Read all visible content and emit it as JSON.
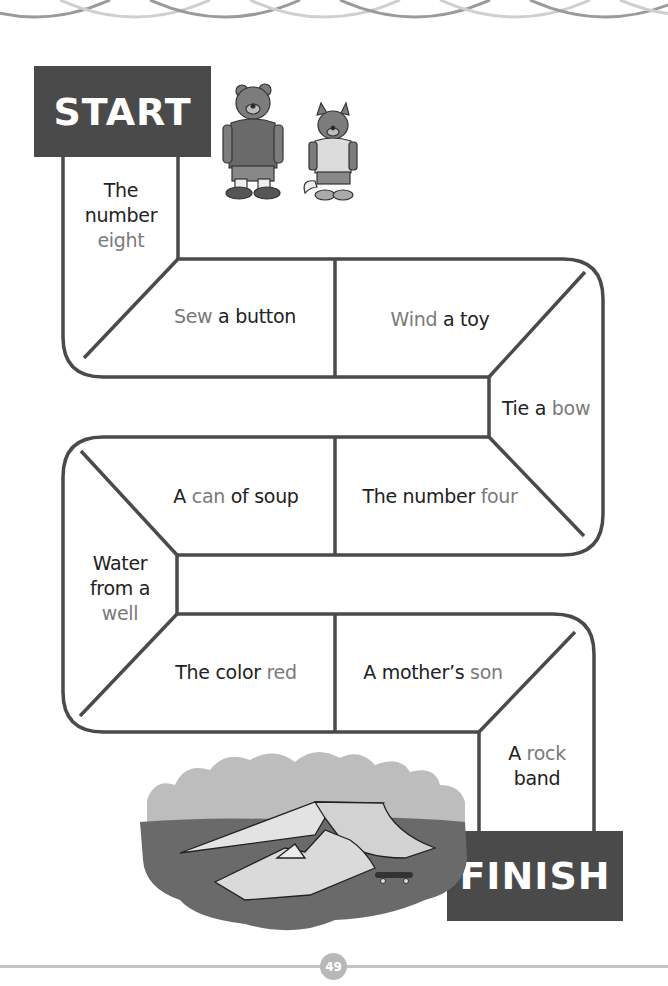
{
  "board": {
    "start_label": "START",
    "finish_label": "FINISH",
    "spaces": [
      {
        "id": 1,
        "parts": [
          {
            "t": "The",
            "hl": false
          },
          {
            "t": "number",
            "hl": false,
            "br": true
          },
          {
            "t": "eight",
            "hl": true,
            "br": true
          }
        ]
      },
      {
        "id": 2,
        "parts": [
          {
            "t": "Sew",
            "hl": true
          },
          {
            "t": " a button",
            "hl": false
          }
        ]
      },
      {
        "id": 3,
        "parts": [
          {
            "t": "Wind",
            "hl": true
          },
          {
            "t": " a toy",
            "hl": false
          }
        ]
      },
      {
        "id": 4,
        "parts": [
          {
            "t": "Tie a ",
            "hl": false
          },
          {
            "t": "bow",
            "hl": true
          }
        ]
      },
      {
        "id": 5,
        "parts": [
          {
            "t": "The number ",
            "hl": false
          },
          {
            "t": "four",
            "hl": true
          }
        ]
      },
      {
        "id": 6,
        "parts": [
          {
            "t": "A ",
            "hl": false
          },
          {
            "t": "can",
            "hl": true
          },
          {
            "t": " of soup",
            "hl": false
          }
        ]
      },
      {
        "id": 7,
        "parts": [
          {
            "t": "Water",
            "hl": false
          },
          {
            "t": "from a",
            "hl": false,
            "br": true
          },
          {
            "t": "well",
            "hl": true,
            "br": true
          }
        ]
      },
      {
        "id": 8,
        "parts": [
          {
            "t": "The color ",
            "hl": false
          },
          {
            "t": "red",
            "hl": true
          }
        ]
      },
      {
        "id": 9,
        "parts": [
          {
            "t": "A mother’s ",
            "hl": false
          },
          {
            "t": "son",
            "hl": true
          }
        ]
      },
      {
        "id": 10,
        "parts": [
          {
            "t": "A ",
            "hl": false
          },
          {
            "t": "rock",
            "hl": true
          },
          {
            "t": "band",
            "hl": false,
            "br": true
          }
        ]
      }
    ]
  },
  "illustrations": {
    "characters": [
      "bear-character",
      "wolf-character"
    ],
    "scene": "skate-park-ramps"
  },
  "footer": {
    "page_number": "49"
  },
  "colors": {
    "outline": "#4a4a4a",
    "sign_bg": "#4a4a4a",
    "highlight_text": "#7a7a7a",
    "body_text": "#222222",
    "page_badge": "#b8b8b8"
  }
}
